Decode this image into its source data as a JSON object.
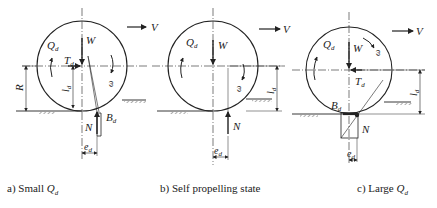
{
  "figure": {
    "panels": [
      {
        "id": "a",
        "caption_prefix": "a) Small ",
        "caption_symbol": "Q",
        "caption_sub": "d",
        "labels": {
          "Q": "Q",
          "Q_sub": "d",
          "W": "W",
          "T": "T",
          "T_sub": "d",
          "omega": "ω",
          "R": "R",
          "l": "l",
          "l_sub": "d",
          "B": "B",
          "B_sub": "d",
          "N": "N",
          "e": "e",
          "e_sub": "d",
          "V": "V"
        }
      },
      {
        "id": "b",
        "caption_prefix": "b) Self propelling state",
        "caption_symbol": "",
        "caption_sub": "",
        "labels": {
          "Q": "Q",
          "Q_sub": "d",
          "W": "W",
          "omega": "ω",
          "l": "l",
          "l_sub": "d",
          "N": "N",
          "e": "e",
          "e_sub": "d",
          "V": "V"
        }
      },
      {
        "id": "c",
        "caption_prefix": "c) Large ",
        "caption_symbol": "Q",
        "caption_sub": "d",
        "labels": {
          "Q": "Q",
          "Q_sub": "d",
          "W": "W",
          "T": "T",
          "T_sub": "d",
          "omega": "ω",
          "l": "l",
          "l_sub": "d",
          "B": "B",
          "B_sub": "d",
          "N": "N",
          "e": "e",
          "e_sub": "d",
          "V": "V"
        }
      }
    ],
    "colors": {
      "ink": "#222222",
      "background": "#ffffff"
    }
  }
}
